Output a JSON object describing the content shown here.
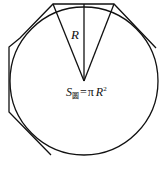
{
  "diagram": {
    "radius_label": "R",
    "formula": {
      "symbol": "S",
      "subscript": "圆",
      "equals": "=",
      "pi": "π",
      "var": "R",
      "exponent": "2"
    },
    "colors": {
      "stroke": "#111111",
      "background": "#ffffff"
    }
  }
}
